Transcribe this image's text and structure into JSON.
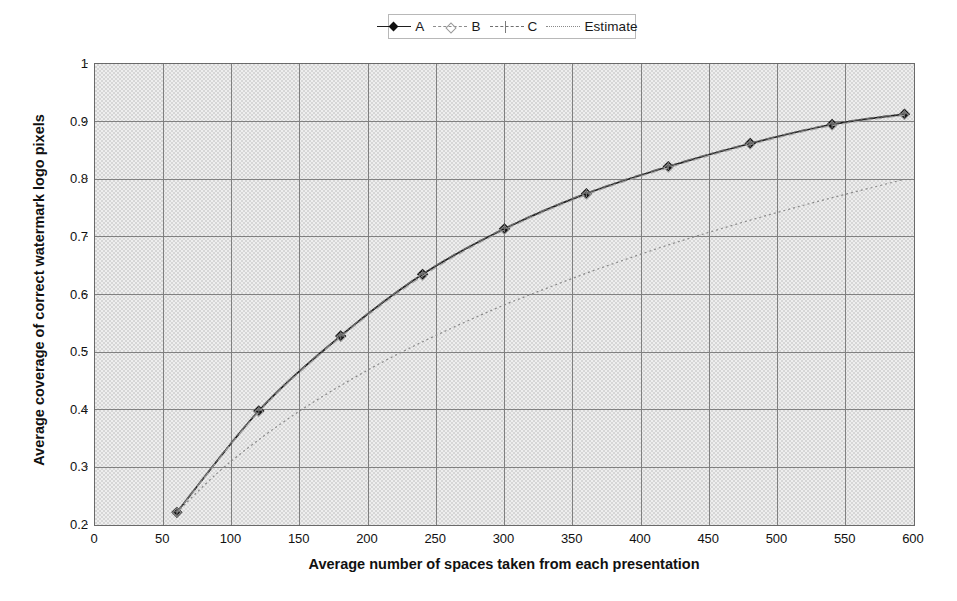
{
  "chart_data": {
    "type": "line",
    "title": "",
    "xlabel": "Average number of spaces taken from each presentation",
    "ylabel": "Average coverage of correct watermark logo pixels",
    "xlim": [
      0,
      600
    ],
    "ylim": [
      0.2,
      1
    ],
    "xticks": [
      0,
      50,
      100,
      150,
      200,
      250,
      300,
      350,
      400,
      450,
      500,
      550,
      600
    ],
    "yticks": [
      0.2,
      0.3,
      0.4,
      0.5,
      0.6,
      0.7,
      0.8,
      0.9,
      1
    ],
    "grid": true,
    "legend_position": "top-center",
    "series": [
      {
        "name": "A",
        "style": "solid-diamond",
        "color": "#1f1f1f",
        "x": [
          60,
          120,
          180,
          240,
          300,
          360,
          420,
          480,
          540,
          593
        ],
        "y": [
          0.222,
          0.398,
          0.528,
          0.635,
          0.714,
          0.775,
          0.822,
          0.862,
          0.895,
          0.913
        ]
      },
      {
        "name": "B",
        "style": "dashed-light",
        "color": "#a0a0a0",
        "x": [
          60,
          120,
          180,
          240,
          300,
          360,
          420,
          480,
          540,
          593
        ],
        "y": [
          0.222,
          0.396,
          0.526,
          0.632,
          0.712,
          0.773,
          0.82,
          0.86,
          0.893,
          0.911
        ]
      },
      {
        "name": "C",
        "style": "dash-dot-plus",
        "color": "#6f6f6f",
        "x": [
          60,
          120,
          180,
          240,
          300,
          360,
          420,
          480,
          540,
          593
        ],
        "y": [
          0.223,
          0.399,
          0.529,
          0.636,
          0.715,
          0.776,
          0.823,
          0.863,
          0.896,
          0.914
        ]
      },
      {
        "name": "Estimate",
        "style": "dotted",
        "color": "#8a8a8a",
        "x": [
          60,
          90,
          120,
          150,
          180,
          210,
          240,
          270,
          300,
          330,
          360,
          390,
          420,
          450,
          480,
          510,
          540,
          570,
          593
        ],
        "y": [
          0.222,
          0.291,
          0.348,
          0.398,
          0.442,
          0.482,
          0.518,
          0.551,
          0.582,
          0.61,
          0.637,
          0.662,
          0.686,
          0.708,
          0.729,
          0.749,
          0.768,
          0.786,
          0.8
        ]
      }
    ]
  },
  "legend": {
    "entries": [
      {
        "label": "A",
        "style": "solid-diamond"
      },
      {
        "label": "B",
        "style": "dashed-light"
      },
      {
        "label": "C",
        "style": "dash-dot-plus"
      },
      {
        "label": "Estimate",
        "style": "dotted"
      }
    ]
  },
  "axes": {
    "y_title": "Average coverage of correct watermark logo pixels",
    "x_title": "Average number of spaces taken from each presentation",
    "y_tick_labels": [
      "1",
      "0.9",
      "0.8",
      "0.7",
      "0.6",
      "0.5",
      "0.4",
      "0.3",
      "0.2"
    ],
    "x_tick_labels": [
      "0",
      "50",
      "100",
      "150",
      "200",
      "250",
      "300",
      "350",
      "400",
      "450",
      "500",
      "550",
      "600"
    ]
  },
  "colors": {
    "series_a": "#1f1f1f",
    "series_b": "#a0a0a0",
    "series_c": "#6f6f6f",
    "series_estimate": "#8a8a8a",
    "grid": "#808080",
    "plot_background": "#e2e2e2",
    "frame": "#6a6a6a"
  }
}
